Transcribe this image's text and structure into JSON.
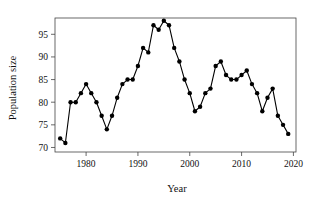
{
  "chart_data": {
    "type": "line",
    "title": "",
    "xlabel": "Year",
    "ylabel": "Population size",
    "xlim": [
      1974,
      2020.5
    ],
    "ylim": [
      69.0,
      98.6
    ],
    "grid": false,
    "legend": false,
    "marker": "filled-circle",
    "line_color": "#000000",
    "marker_color": "#000000",
    "xticks": [
      1980,
      1990,
      2000,
      2010,
      2020
    ],
    "xtick_labels": [
      "1980",
      "1990",
      "2000",
      "2010",
      "2020"
    ],
    "yticks": [
      70,
      75,
      80,
      85,
      90,
      95
    ],
    "ytick_labels": [
      "70",
      "75",
      "80",
      "85",
      "90",
      "95"
    ],
    "x": [
      1975,
      1976,
      1977,
      1978,
      1979,
      1980,
      1981,
      1982,
      1983,
      1984,
      1985,
      1986,
      1987,
      1988,
      1989,
      1990,
      1991,
      1992,
      1993,
      1994,
      1995,
      1996,
      1997,
      1998,
      1999,
      2000,
      2001,
      2002,
      2003,
      2004,
      2005,
      2006,
      2007,
      2008,
      2009,
      2010,
      2011,
      2012,
      2013,
      2014,
      2015,
      2016,
      2017,
      2018,
      2019
    ],
    "values": [
      72,
      71,
      80,
      80,
      82,
      84,
      82,
      80,
      77,
      74,
      77,
      81,
      84,
      85,
      85,
      88,
      92,
      91,
      97,
      96,
      98,
      97,
      92,
      89,
      85,
      82,
      78,
      79,
      82,
      83,
      88,
      89,
      86,
      85,
      85,
      86,
      87,
      84,
      82,
      78,
      81,
      83,
      77,
      75,
      73
    ],
    "series": [
      {
        "name": "Population size",
        "values": [
          72,
          71,
          80,
          80,
          82,
          84,
          82,
          80,
          77,
          74,
          77,
          81,
          84,
          85,
          85,
          88,
          92,
          91,
          97,
          96,
          98,
          97,
          92,
          89,
          85,
          82,
          78,
          79,
          82,
          83,
          88,
          89,
          86,
          85,
          85,
          86,
          87,
          84,
          82,
          78,
          81,
          83,
          77,
          75,
          73
        ]
      }
    ]
  },
  "axes": {
    "x_title": "Year",
    "y_title": "Population size"
  }
}
